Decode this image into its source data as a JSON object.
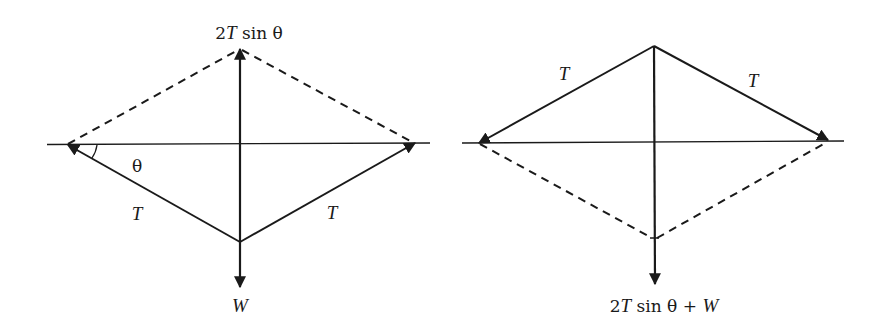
{
  "colors": {
    "ink": "#1a1a1a",
    "background": "#ffffff"
  },
  "diagrams": [
    {
      "id": "left",
      "labels": {
        "resultant_up": {
          "prefix": "2",
          "var": "T",
          "suffix": " sin  θ"
        },
        "angle": "θ",
        "tension_left": "T",
        "tension_right": "T",
        "weight": "W"
      },
      "geometry": {
        "horizontal_axis": {
          "x1": 47,
          "x2": 430,
          "y": 144
        },
        "left_tip": [
          67,
          145
        ],
        "right_tip": [
          415,
          143
        ],
        "apex_top": [
          240,
          49
        ],
        "apex_bottom": [
          240,
          242
        ],
        "weight_tip": [
          240,
          287
        ]
      }
    },
    {
      "id": "right",
      "labels": {
        "tension_left": "T",
        "tension_right": "T",
        "resultant_down": {
          "prefix": "2",
          "var": "T",
          "middle": " sin θ + ",
          "var2": "W"
        }
      },
      "geometry": {
        "horizontal_axis": {
          "x1": 462,
          "x2": 844,
          "y": 142
        },
        "left_tip": [
          478,
          143
        ],
        "right_tip": [
          828,
          140
        ],
        "apex_top": [
          654,
          46
        ],
        "dashed_bottom": [
          654,
          238
        ],
        "resultant_tip": [
          655,
          284
        ]
      }
    }
  ]
}
